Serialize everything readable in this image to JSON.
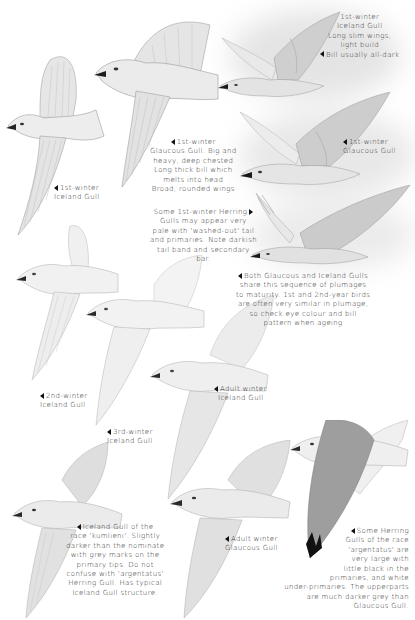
{
  "plate": {
    "subject": "Glaucous and Iceland Gulls - plumage sequence",
    "background_color": "#ffffff",
    "ink_color": "#2a2a2a",
    "pencil_tone": "#9a9a9a"
  },
  "captions": {
    "ice1_top": {
      "lines": [
        "1st-winter",
        "Iceland Gull",
        "Long slim wings,",
        "light build",
        "Bill usually all-dark"
      ],
      "pointer": "left"
    },
    "glaucous1_big": {
      "lines": [
        "1st-winter",
        "Glaucous Gull. Big and",
        "heavy, deep chested",
        "Long thick bill which",
        "melts into head",
        "Broad, rounded wings"
      ],
      "pointer": "left"
    },
    "glaucous1_right": {
      "lines": [
        "1st-winter",
        "Glaucous Gull"
      ],
      "pointer": "left"
    },
    "ice1_left": {
      "lines": [
        "1st-winter",
        "Iceland Gull"
      ],
      "pointer": "left"
    },
    "herring_pale": {
      "lines": [
        "Some 1st-winter Herring",
        "Gulls may appear very",
        "pale with 'washed-out' tail",
        "and primaries. Note darkish",
        "tail band and secondary",
        "bar."
      ],
      "pointer": "right"
    },
    "sequence_note": {
      "lines": [
        "Both Glaucous and Iceland Gulls",
        "share this sequence of plumages",
        "to maturity. 1st and 2nd-year birds",
        "are often very similar in plumage,",
        "so check eye colour and bill",
        "pattern when ageing"
      ],
      "pointer": "left"
    },
    "adult_winter_iceland": {
      "lines": [
        "Adult winter",
        "Iceland Gull"
      ],
      "pointer": "left"
    },
    "ice2": {
      "lines": [
        "2nd-winter",
        "Iceland Gull"
      ],
      "pointer": "left"
    },
    "ice3": {
      "lines": [
        "3rd-winter",
        "Iceland Gull"
      ],
      "pointer": "left"
    },
    "kumlieni": {
      "lines": [
        "Iceland Gull of the",
        "race 'kumlieni'. Slightly",
        "darker than the nominate",
        "with grey marks on the",
        "primary tips. Do not",
        "confuse with 'argentatus'",
        "Herring Gull. Has typical",
        "Iceland Gull structure."
      ],
      "pointer": "left"
    },
    "adult_winter_glaucous": {
      "lines": [
        "Adult winter",
        "Glaucous Gull"
      ],
      "pointer": "left"
    },
    "argentatus": {
      "lines": [
        "Some Herring",
        "Gulls of the race",
        "'argentatus' are",
        "very large with",
        "little black in the",
        "primaries, and white",
        "under-primaries. The upperparts",
        "are much darker grey than",
        "Glaucous Gull."
      ],
      "pointer": "left"
    }
  },
  "icons": {
    "pointer_left": "left-pointing-triangle-icon",
    "pointer_right": "right-pointing-triangle-icon"
  }
}
